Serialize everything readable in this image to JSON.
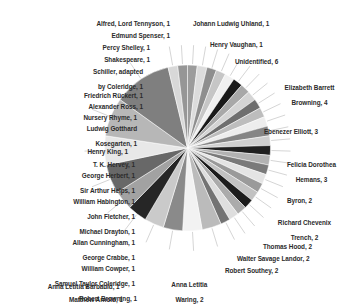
{
  "chart_data": {
    "type": "pie",
    "title": "",
    "total": 55,
    "legend_position": "labels-with-leader-lines",
    "grid": false,
    "start_angle_deg": -90,
    "direction": "clockwise",
    "categories": [
      "Unidentified",
      "Elizabeth Barrett Browning",
      "Ebenezer Elliott",
      "Felicia Dorothea Hemans",
      "Byron",
      "Richard Chevenix Trench",
      "Thomas Hood",
      "Walter Savage Landor",
      "Robert Southey",
      "Anna Letitia Waring",
      "Matthew Arnold",
      "Anna Letitia Barbauld",
      "Robert Browning",
      "Samuel Taylor Coleridge",
      "William Cowper",
      "George Crabbe",
      "Allan Cunningham",
      "Michael Drayton",
      "John Fletcher",
      "William Habington",
      "Sir Arthur Helps",
      "George Herbert",
      "T. K. Hervey",
      "Henry King",
      "Ludwig Gotthard Kosegarten",
      "Nursery Rhyme",
      "Alexander Ross",
      "Friedrich Rückert",
      "Schiller, adapted by Coleridge",
      "Shakespeare",
      "Percy Shelley",
      "Edmund Spenser",
      "Alfred, Lord Tennyson",
      "Johann Ludwig Uhland",
      "Henry Vaughan"
    ],
    "values": [
      6,
      4,
      3,
      3,
      2,
      2,
      2,
      2,
      2,
      2,
      1,
      1,
      1,
      1,
      1,
      1,
      1,
      1,
      1,
      1,
      1,
      1,
      1,
      1,
      1,
      1,
      1,
      1,
      1,
      1,
      1,
      1,
      1,
      1,
      1
    ],
    "colors": [
      "#8b8b8b",
      "#c9c9c9",
      "#a5a5a5",
      "#161616",
      "#d9d9d9",
      "#8e8e8e",
      "#efefef",
      "#b4b4b4",
      "#757575",
      "#dcdcdc",
      "#9a9a9a",
      "#1c1c1c",
      "#cfcfcf",
      "#8a8a8a",
      "#f2f2f2",
      "#a8a8a8",
      "#6f6f6f",
      "#d2d2d2",
      "#959595",
      "#202020",
      "#c4c4c4",
      "#7e7e7e",
      "#ededed",
      "#b0b0b0",
      "#6a6a6a",
      "#dfdfdf",
      "#9f9f9f",
      "#242424",
      "#cacaca",
      "#868686",
      "#f4f4f4",
      "#ababab",
      "#727272",
      "#d6d6d6",
      "#999999"
    ],
    "slices": [
      {
        "label": "Alfred, Lord Tennyson, 1",
        "name": "Alfred, Lord Tennyson",
        "value": 1
      },
      {
        "label": "Edmund Spenser, 1",
        "name": "Edmund Spenser",
        "value": 1
      },
      {
        "label": "Percy Shelley, 1",
        "name": "Percy Shelley",
        "value": 1
      },
      {
        "label": "Shakespeare, 1",
        "name": "Shakespeare",
        "value": 1
      },
      {
        "label": "Schiller, adapted by Coleridge, 1",
        "name": "Schiller, adapted by Coleridge",
        "value": 1
      },
      {
        "label": "Friedrich Rückert, 1",
        "name": "Friedrich Rückert",
        "value": 1
      },
      {
        "label": "Alexander Ross, 1",
        "name": "Alexander Ross",
        "value": 1
      },
      {
        "label": "Nursery Rhyme, 1",
        "name": "Nursery Rhyme",
        "value": 1
      },
      {
        "label": "Ludwig Gotthard Kosegarten, 1",
        "name": "Ludwig Gotthard Kosegarten",
        "value": 1
      },
      {
        "label": "Henry King, 1",
        "name": "Henry King",
        "value": 1
      },
      {
        "label": "T. K. Hervey, 1",
        "name": "T. K. Hervey",
        "value": 1
      },
      {
        "label": "George Herbert, 1",
        "name": "George Herbert",
        "value": 1
      },
      {
        "label": "Sir Arthur Helps, 1",
        "name": "Sir Arthur Helps",
        "value": 1
      },
      {
        "label": "William Habington, 1",
        "name": "William Habington",
        "value": 1
      },
      {
        "label": "John Fletcher, 1",
        "name": "John Fletcher",
        "value": 1
      },
      {
        "label": "Michael Drayton, 1",
        "name": "Michael Drayton",
        "value": 1
      },
      {
        "label": "Allan Cunningham, 1",
        "name": "Allan Cunningham",
        "value": 1
      },
      {
        "label": "George Crabbe, 1",
        "name": "George Crabbe",
        "value": 1
      },
      {
        "label": "William Cowper, 1",
        "name": "William Cowper",
        "value": 1
      },
      {
        "label": "Samuel Taylor Coleridge, 1",
        "name": "Samuel Taylor Coleridge",
        "value": 1
      },
      {
        "label": "Robert Browning, 1",
        "name": "Robert Browning",
        "value": 1
      },
      {
        "label": "Anna Letitia Barbauld, 1",
        "name": "Anna Letitia Barbauld",
        "value": 1
      },
      {
        "label": "Matthew Arnold, 1",
        "name": "Matthew Arnold",
        "value": 1
      },
      {
        "label": "Anna Letitia Waring, 2",
        "name": "Anna Letitia Waring",
        "value": 2
      },
      {
        "label": "Robert Southey, 2",
        "name": "Robert Southey",
        "value": 2
      },
      {
        "label": "Walter Savage Landor, 2",
        "name": "Walter Savage Landor",
        "value": 2
      },
      {
        "label": "Thomas Hood, 2",
        "name": "Thomas Hood",
        "value": 2
      },
      {
        "label": "Richard Chevenix Trench, 2",
        "name": "Richard Chevenix Trench",
        "value": 2
      },
      {
        "label": "Byron, 2",
        "name": "Byron",
        "value": 2
      },
      {
        "label": "Felicia Dorothea Hemans, 3",
        "name": "Felicia Dorothea Hemans",
        "value": 3
      },
      {
        "label": "Ebenezer Elliott, 3",
        "name": "Ebenezer Elliott",
        "value": 3
      },
      {
        "label": "Elizabeth Barrett Browning, 4",
        "name": "Elizabeth Barrett Browning",
        "value": 4
      },
      {
        "label": "Unidentified, 6",
        "name": "Unidentified",
        "value": 6
      },
      {
        "label": "Henry Vaughan, 1",
        "name": "Henry Vaughan",
        "value": 1
      },
      {
        "label": "Johann Ludwig Uhland, 1",
        "name": "Johann Ludwig Uhland",
        "value": 1
      }
    ]
  },
  "labels": {
    "tennyson": "Alfred, Lord Tennyson, 1",
    "spenser": "Edmund Spenser, 1",
    "shelley": "Percy Shelley, 1",
    "shakespeare": "Shakespeare, 1",
    "schiller_line1": "Schiller, adapted",
    "schiller_line2": "by Coleridge, 1",
    "ruckert": "Friedrich Rückert, 1",
    "ross": "Alexander Ross, 1",
    "nursery": "Nursery Rhyme, 1",
    "kosegarten_line1": "Ludwig Gotthard",
    "kosegarten_line2": "Kosegarten, 1",
    "king": "Henry King, 1",
    "hervey": "T. K. Hervey, 1",
    "herbert": "George Herbert, 1",
    "helps": "Sir Arthur Helps, 1",
    "habington": "William Habington, 1",
    "fletcher": "John Fletcher, 1",
    "drayton": "Michael Drayton, 1",
    "cunningham": "Allan Cunningham, 1",
    "crabbe": "George Crabbe, 1",
    "cowper": "William Cowper, 1",
    "stcoleridge": "Samuel Taylor Coleridge, 1",
    "rbrowning": "Robert Browning, 1",
    "barbauld": "Anna Letitia Barbauld, 1",
    "arnold": "Matthew Arnold, 1",
    "waring_line1": "Anna Letitia",
    "waring_line2": "Waring, 2",
    "southey": "Robert Southey, 2",
    "landor": "Walter Savage Landor, 2",
    "hood": "Thomas Hood, 2",
    "trench_line1": "Richard Chevenix",
    "trench_line2": "Trench, 2",
    "byron": "Byron, 2",
    "hemans_line1": "Felicia Dorothea",
    "hemans_line2": "Hemans, 3",
    "elliott": "Ebenezer Elliott, 3",
    "ebb_line1": "Elizabeth Barrett",
    "ebb_line2": "Browning, 4",
    "unidentified": "Unidentified, 6",
    "vaughan": "Henry Vaughan, 1",
    "uhland": "Johann Ludwig Uhland, 1"
  }
}
